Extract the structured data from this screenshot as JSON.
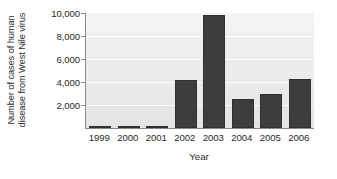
{
  "chart_data": {
    "type": "bar",
    "title": "",
    "xlabel": "Year",
    "ylabel": "Number of cases of human disease from West Nile virus",
    "ylabel_lines": [
      "Number of cases of human",
      "disease from West Nile virus"
    ],
    "categories": [
      "1999",
      "2000",
      "2001",
      "2002",
      "2003",
      "2004",
      "2005",
      "2006"
    ],
    "values": [
      62,
      21,
      66,
      4156,
      9862,
      2539,
      3000,
      4269
    ],
    "ylim": [
      0,
      10000
    ],
    "yticks": [
      2000,
      4000,
      6000,
      8000,
      10000
    ],
    "ytick_labels": [
      "2,000",
      "4,000",
      "6,000",
      "8,000",
      "10,000"
    ],
    "grid": true,
    "grid_axis": "y",
    "legend": false,
    "legend_position": "none",
    "bar_color": "#3d3d3d",
    "plot_background": "#efefef",
    "axis_color": "#8a8a8a",
    "text_color": "#2a2a2a"
  }
}
